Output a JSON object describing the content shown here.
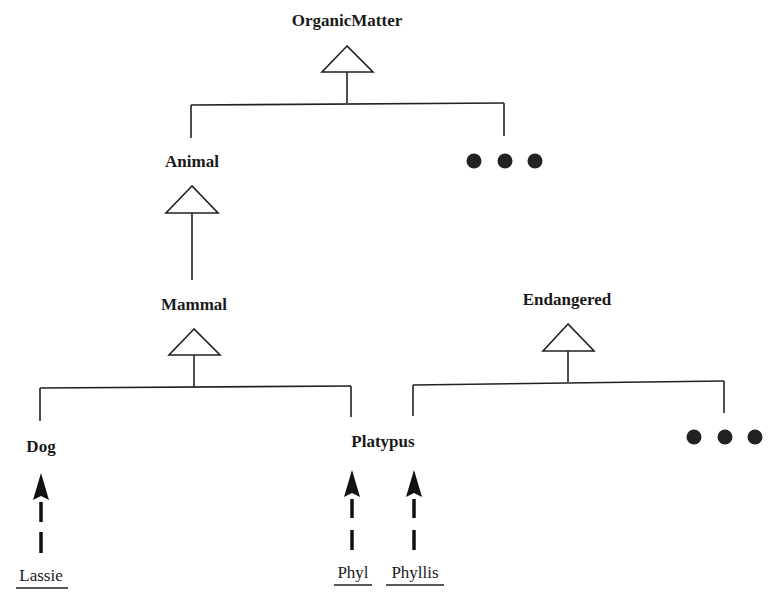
{
  "diagram": {
    "type": "class-hierarchy",
    "classes": [
      {
        "id": "organic",
        "label": "OrganicMatter"
      },
      {
        "id": "animal",
        "label": "Animal"
      },
      {
        "id": "mammal",
        "label": "Mammal"
      },
      {
        "id": "dog",
        "label": "Dog"
      },
      {
        "id": "platypus",
        "label": "Platypus"
      },
      {
        "id": "endangered",
        "label": "Endangered"
      }
    ],
    "instances": [
      {
        "id": "lassie",
        "label": "Lassie",
        "instance_of": "Dog"
      },
      {
        "id": "phyl",
        "label": "Phyl",
        "instance_of": "Platypus"
      },
      {
        "id": "phyllis",
        "label": "Phyllis",
        "instance_of": "Platypus"
      }
    ],
    "generalizations": [
      {
        "parent": "OrganicMatter",
        "children": [
          "Animal",
          "..."
        ]
      },
      {
        "parent": "Animal",
        "children": [
          "Mammal"
        ]
      },
      {
        "parent": "Mammal",
        "children": [
          "Dog",
          "Platypus"
        ]
      },
      {
        "parent": "Endangered",
        "children": [
          "Platypus",
          "..."
        ]
      }
    ],
    "ellipsis_markers": [
      {
        "under": "OrganicMatter",
        "symbol": "..."
      },
      {
        "under": "Endangered",
        "symbol": "..."
      }
    ]
  }
}
